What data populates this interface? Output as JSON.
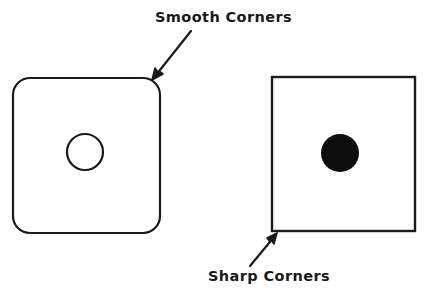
{
  "figure": {
    "background_color": "#ffffff",
    "stroke_color": "#1a1a1a",
    "fill_color": "#0d0d0d",
    "stroke_width": 2.2
  },
  "annotations": {
    "top": {
      "label": "Smooth Corners",
      "text_x": 155,
      "text_y": 22,
      "arrow_from_x": 191,
      "arrow_from_y": 31,
      "arrow_to_x": 152,
      "arrow_to_y": 80
    },
    "bottom": {
      "label": "Sharp Corners",
      "text_x": 208,
      "text_y": 281,
      "arrow_from_x": 250,
      "arrow_from_y": 266,
      "arrow_to_x": 277,
      "arrow_to_y": 233
    }
  },
  "shapes": {
    "rounded_square": {
      "name": "rounded-square",
      "x": 13,
      "y": 78,
      "width": 147,
      "height": 155,
      "corner_radius": 17
    },
    "hollow_circle": {
      "name": "hollow-circle",
      "cx": 85,
      "cy": 152,
      "r": 18,
      "filled": false
    },
    "sharp_square": {
      "name": "sharp-square",
      "x": 272,
      "y": 77,
      "width": 143,
      "height": 154,
      "corner_radius": 0
    },
    "filled_circle": {
      "name": "filled-circle",
      "cx": 340,
      "cy": 153,
      "r": 19,
      "filled": true
    }
  }
}
